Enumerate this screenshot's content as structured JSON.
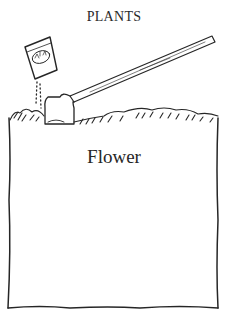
{
  "heading": {
    "title": "PLANTS"
  },
  "card": {
    "label": "Flower"
  },
  "illustration": {
    "icons": [
      "seed-packet-icon",
      "hoe-icon",
      "soil-icon"
    ],
    "packet_text": "MIN"
  },
  "colors": {
    "ink": "#262626",
    "background": "#ffffff"
  }
}
